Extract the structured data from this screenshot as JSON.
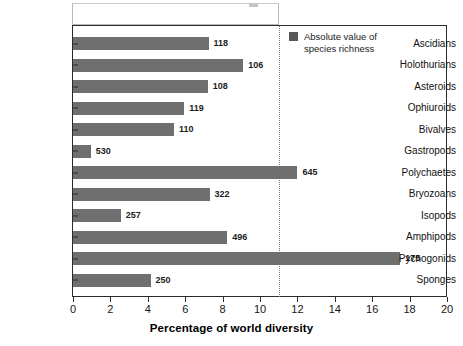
{
  "chart_data": {
    "type": "bar",
    "orientation": "horizontal",
    "title": "",
    "xlabel": "Percentage of world diversity",
    "ylabel": "",
    "xlim": [
      0,
      20
    ],
    "xticks": [
      0,
      2,
      4,
      6,
      8,
      10,
      12,
      14,
      16,
      18,
      20
    ],
    "grid": false,
    "legend": {
      "position": "top-right",
      "entries": [
        {
          "label": "Absolute value of\nspecies richness",
          "color": "#585858"
        }
      ]
    },
    "annotations": [
      {
        "type": "vline",
        "value": 11,
        "style": "dotted",
        "color": "#7a7a7a"
      }
    ],
    "bar_color": "#6f6f6f",
    "categories": [
      "Ascidians",
      "Holothurians",
      "Asteroids",
      "Ophiuroids",
      "Bivalves",
      "Gastropods",
      "Polychaetes",
      "Bryozoans",
      "Isopods",
      "Amphipods",
      "Pycnogonids",
      "Sponges"
    ],
    "values": [
      7.25,
      9.1,
      7.2,
      5.95,
      5.4,
      0.95,
      12.0,
      7.3,
      2.55,
      8.25,
      17.5,
      4.15
    ],
    "data_labels": [
      "118",
      "106",
      "108",
      "119",
      "110",
      "530",
      "645",
      "322",
      "257",
      "496",
      "175",
      "250"
    ],
    "series": [
      {
        "name": "Percentage of world diversity",
        "values": [
          7.25,
          9.1,
          7.2,
          5.95,
          5.4,
          0.95,
          12.0,
          7.3,
          2.55,
          8.25,
          17.5,
          4.15
        ]
      },
      {
        "name": "Absolute value of species richness",
        "values": [
          118,
          106,
          108,
          119,
          110,
          530,
          645,
          322,
          257,
          496,
          175,
          250
        ]
      }
    ]
  }
}
